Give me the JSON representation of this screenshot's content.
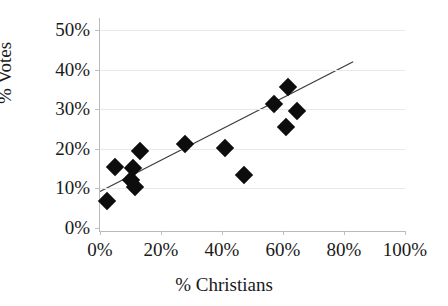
{
  "chart_data": {
    "type": "scatter",
    "title": "",
    "xlabel": "% Christians",
    "ylabel": "% Votes",
    "xlim": [
      0,
      100
    ],
    "ylim": [
      0,
      50
    ],
    "xticks": [
      "0%",
      "20%",
      "40%",
      "60%",
      "80%",
      "100%"
    ],
    "xtick_values": [
      0,
      20,
      40,
      60,
      80,
      100
    ],
    "yticks": [
      "0%",
      "10%",
      "20%",
      "30%",
      "40%",
      "50%"
    ],
    "ytick_values": [
      0,
      10,
      20,
      30,
      40,
      50
    ],
    "grid": true,
    "legend": null,
    "marker_shape": "diamond",
    "marker_color": "#0d0d0d",
    "points": [
      {
        "x": 2.4,
        "y": 6.8
      },
      {
        "x": 5.0,
        "y": 15.5
      },
      {
        "x": 10.8,
        "y": 15.2
      },
      {
        "x": 13.2,
        "y": 19.4
      },
      {
        "x": 10.3,
        "y": 12.0
      },
      {
        "x": 11.4,
        "y": 10.4
      },
      {
        "x": 27.9,
        "y": 21.3
      },
      {
        "x": 41.0,
        "y": 20.2
      },
      {
        "x": 47.2,
        "y": 13.5
      },
      {
        "x": 57.0,
        "y": 31.3
      },
      {
        "x": 61.5,
        "y": 35.6
      },
      {
        "x": 61.0,
        "y": 25.5
      },
      {
        "x": 64.5,
        "y": 29.6
      }
    ],
    "trendline": {
      "type": "linear",
      "x_start": 0,
      "y_start": 9.2,
      "x_end": 83,
      "y_end": 42.0,
      "color": "#3a3a3a"
    }
  }
}
